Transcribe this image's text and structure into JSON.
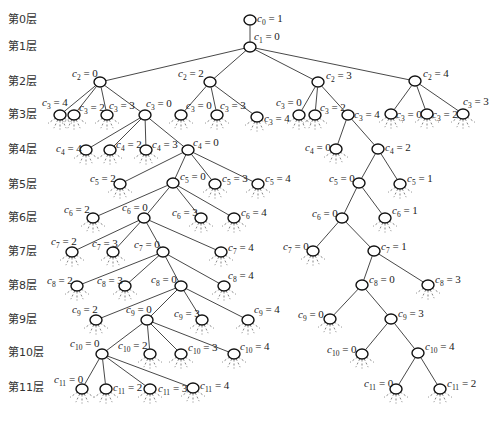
{
  "layer_labels": [
    {
      "text": "第0层",
      "y": 23
    },
    {
      "text": "第1层",
      "y": 50
    },
    {
      "text": "第2层",
      "y": 85
    },
    {
      "text": "第3层",
      "y": 118
    },
    {
      "text": "第4层",
      "y": 153
    },
    {
      "text": "第5层",
      "y": 188
    },
    {
      "text": "第6层",
      "y": 221
    },
    {
      "text": "第7层",
      "y": 255
    },
    {
      "text": "第8层",
      "y": 289
    },
    {
      "text": "第9层",
      "y": 323
    },
    {
      "text": "第10层",
      "y": 356
    },
    {
      "text": "第11层",
      "y": 391
    }
  ],
  "nodes": [
    {
      "id": "n0",
      "var": "c",
      "sub": "0",
      "val": "1",
      "x": 250,
      "y": 20,
      "parent": null,
      "lx": 257,
      "ly": 22,
      "anchor": "start",
      "stub": false
    },
    {
      "id": "n1",
      "var": "c",
      "sub": "1",
      "val": "0",
      "x": 250,
      "y": 47,
      "parent": "n0",
      "lx": 254,
      "ly": 40,
      "anchor": "start",
      "stub": false
    },
    {
      "id": "a2",
      "var": "c",
      "sub": "2",
      "val": "0",
      "x": 100,
      "y": 82,
      "parent": "n1",
      "lx": 72,
      "ly": 77,
      "anchor": "start",
      "stub": false
    },
    {
      "id": "b2",
      "var": "c",
      "sub": "2",
      "val": "2",
      "x": 210,
      "y": 82,
      "parent": "n1",
      "lx": 178,
      "ly": 77,
      "anchor": "start",
      "stub": false
    },
    {
      "id": "c2",
      "var": "c",
      "sub": "2",
      "val": "3",
      "x": 318,
      "y": 82,
      "parent": "n1",
      "lx": 326,
      "ly": 79,
      "anchor": "start",
      "stub": false
    },
    {
      "id": "d2",
      "var": "c",
      "sub": "2",
      "val": "4",
      "x": 415,
      "y": 81,
      "parent": "n1",
      "lx": 423,
      "ly": 77,
      "anchor": "start",
      "stub": false
    },
    {
      "id": "a3a",
      "var": "c",
      "sub": "3",
      "val": "4",
      "x": 60,
      "y": 115,
      "parent": "a2",
      "lx": 42,
      "ly": 106,
      "anchor": "start",
      "stub": true
    },
    {
      "id": "a3b",
      "var": "c",
      "sub": "3",
      "val": "2",
      "x": 74,
      "y": 115,
      "parent": "a2",
      "lx": 79,
      "ly": 111,
      "anchor": "start",
      "stub": true
    },
    {
      "id": "a3c",
      "var": "c",
      "sub": "3",
      "val": "3",
      "x": 107,
      "y": 115,
      "parent": "a2",
      "lx": 109,
      "ly": 109,
      "anchor": "start",
      "stub": true
    },
    {
      "id": "a3d",
      "var": "c",
      "sub": "3",
      "val": "0",
      "x": 145,
      "y": 115,
      "parent": "a2",
      "lx": 146,
      "ly": 107,
      "anchor": "start",
      "stub": false
    },
    {
      "id": "b3a",
      "var": "c",
      "sub": "3",
      "val": "0",
      "x": 181,
      "y": 115,
      "parent": "b2",
      "lx": 186,
      "ly": 109,
      "anchor": "start",
      "stub": true
    },
    {
      "id": "b3b",
      "var": "c",
      "sub": "3",
      "val": "3",
      "x": 217,
      "y": 115,
      "parent": "b2",
      "lx": 220,
      "ly": 109,
      "anchor": "start",
      "stub": true
    },
    {
      "id": "b3c",
      "var": "c",
      "sub": "3",
      "val": "4",
      "x": 257,
      "y": 117,
      "parent": "b2",
      "lx": 264,
      "ly": 122,
      "anchor": "start",
      "stub": true
    },
    {
      "id": "c3a",
      "var": "c",
      "sub": "3",
      "val": "0",
      "x": 299,
      "y": 115,
      "parent": "c2",
      "lx": 276,
      "ly": 106,
      "anchor": "start",
      "stub": true
    },
    {
      "id": "c3b",
      "var": "c",
      "sub": "3",
      "val": "2",
      "x": 315,
      "y": 115,
      "parent": "c2",
      "lx": 320,
      "ly": 111,
      "anchor": "start",
      "stub": true
    },
    {
      "id": "c3c",
      "var": "c",
      "sub": "3",
      "val": "4",
      "x": 348,
      "y": 115,
      "parent": "c2",
      "lx": 354,
      "ly": 118,
      "anchor": "start",
      "stub": false
    },
    {
      "id": "d3a",
      "var": "c",
      "sub": "3",
      "val": "0",
      "x": 391,
      "y": 114,
      "parent": "d2",
      "lx": 396,
      "ly": 118,
      "anchor": "start",
      "stub": true
    },
    {
      "id": "d3b",
      "var": "c",
      "sub": "3",
      "val": "2",
      "x": 427,
      "y": 114,
      "parent": "d2",
      "lx": 432,
      "ly": 118,
      "anchor": "start",
      "stub": true
    },
    {
      "id": "d3c",
      "var": "c",
      "sub": "3",
      "val": "3",
      "x": 463,
      "y": 114,
      "parent": "d2",
      "lx": 463,
      "ly": 105,
      "anchor": "start",
      "stub": true
    },
    {
      "id": "a4a",
      "var": "c",
      "sub": "4",
      "val": "4",
      "x": 86,
      "y": 150,
      "parent": "a3d",
      "lx": 56,
      "ly": 152,
      "anchor": "start",
      "stub": true
    },
    {
      "id": "a4b",
      "var": "c",
      "sub": "4",
      "val": "2",
      "x": 110,
      "y": 150,
      "parent": "a3d",
      "lx": 116,
      "ly": 148,
      "anchor": "start",
      "stub": true
    },
    {
      "id": "a4c",
      "var": "c",
      "sub": "4",
      "val": "3",
      "x": 146,
      "y": 150,
      "parent": "a3d",
      "lx": 152,
      "ly": 148,
      "anchor": "start",
      "stub": true
    },
    {
      "id": "a4d",
      "var": "c",
      "sub": "4",
      "val": "0",
      "x": 188,
      "y": 150,
      "parent": "a3d",
      "lx": 193,
      "ly": 146,
      "anchor": "start",
      "stub": false
    },
    {
      "id": "c4a",
      "var": "c",
      "sub": "4",
      "val": "0",
      "x": 336,
      "y": 149,
      "parent": "c3c",
      "lx": 305,
      "ly": 151,
      "anchor": "start",
      "stub": true
    },
    {
      "id": "c4b",
      "var": "c",
      "sub": "4",
      "val": "2",
      "x": 378,
      "y": 149,
      "parent": "c3c",
      "lx": 385,
      "ly": 151,
      "anchor": "start",
      "stub": false
    },
    {
      "id": "a5a",
      "var": "c",
      "sub": "5",
      "val": "2",
      "x": 120,
      "y": 184,
      "parent": "a4d",
      "lx": 90,
      "ly": 182,
      "anchor": "start",
      "stub": true
    },
    {
      "id": "a5b",
      "var": "c",
      "sub": "5",
      "val": "0",
      "x": 173,
      "y": 183,
      "parent": "a4d",
      "lx": 180,
      "ly": 180,
      "anchor": "start",
      "stub": false
    },
    {
      "id": "a5c",
      "var": "c",
      "sub": "5",
      "val": "3",
      "x": 215,
      "y": 184,
      "parent": "a4d",
      "lx": 222,
      "ly": 182,
      "anchor": "start",
      "stub": true
    },
    {
      "id": "a5d",
      "var": "c",
      "sub": "5",
      "val": "4",
      "x": 258,
      "y": 184,
      "parent": "a4d",
      "lx": 265,
      "ly": 182,
      "anchor": "start",
      "stub": true
    },
    {
      "id": "c5a",
      "var": "c",
      "sub": "5",
      "val": "0",
      "x": 359,
      "y": 183,
      "parent": "c4b",
      "lx": 329,
      "ly": 182,
      "anchor": "start",
      "stub": false
    },
    {
      "id": "c5b",
      "var": "c",
      "sub": "5",
      "val": "1",
      "x": 400,
      "y": 184,
      "parent": "c4b",
      "lx": 407,
      "ly": 182,
      "anchor": "start",
      "stub": true
    },
    {
      "id": "a6a",
      "var": "c",
      "sub": "6",
      "val": "2",
      "x": 93,
      "y": 218,
      "parent": "a5b",
      "lx": 64,
      "ly": 213,
      "anchor": "start",
      "stub": true
    },
    {
      "id": "a6b",
      "var": "c",
      "sub": "6",
      "val": "0",
      "x": 144,
      "y": 218,
      "parent": "a5b",
      "lx": 122,
      "ly": 211,
      "anchor": "start",
      "stub": false
    },
    {
      "id": "a6c",
      "var": "c",
      "sub": "6",
      "val": "3",
      "x": 201,
      "y": 218,
      "parent": "a5b",
      "lx": 172,
      "ly": 216,
      "anchor": "start",
      "stub": true
    },
    {
      "id": "a6d",
      "var": "c",
      "sub": "6",
      "val": "4",
      "x": 234,
      "y": 218,
      "parent": "a5b",
      "lx": 241,
      "ly": 216,
      "anchor": "start",
      "stub": true
    },
    {
      "id": "c6a",
      "var": "c",
      "sub": "6",
      "val": "0",
      "x": 342,
      "y": 218,
      "parent": "c5a",
      "lx": 312,
      "ly": 217,
      "anchor": "start",
      "stub": false
    },
    {
      "id": "c6b",
      "var": "c",
      "sub": "6",
      "val": "1",
      "x": 385,
      "y": 218,
      "parent": "c5a",
      "lx": 392,
      "ly": 214,
      "anchor": "start",
      "stub": true
    },
    {
      "id": "a7a",
      "var": "c",
      "sub": "7",
      "val": "2",
      "x": 72,
      "y": 252,
      "parent": "a6b",
      "lx": 51,
      "ly": 245,
      "anchor": "start",
      "stub": true
    },
    {
      "id": "a7b",
      "var": "c",
      "sub": "7",
      "val": "3",
      "x": 113,
      "y": 252,
      "parent": "a6b",
      "lx": 92,
      "ly": 247,
      "anchor": "start",
      "stub": true
    },
    {
      "id": "a7c",
      "var": "c",
      "sub": "7",
      "val": "0",
      "x": 163,
      "y": 252,
      "parent": "a6b",
      "lx": 134,
      "ly": 248,
      "anchor": "start",
      "stub": false
    },
    {
      "id": "a7d",
      "var": "c",
      "sub": "7",
      "val": "4",
      "x": 221,
      "y": 252,
      "parent": "a6b",
      "lx": 228,
      "ly": 251,
      "anchor": "start",
      "stub": true
    },
    {
      "id": "c7a",
      "var": "c",
      "sub": "7",
      "val": "0",
      "x": 313,
      "y": 251,
      "parent": "c6a",
      "lx": 283,
      "ly": 250,
      "anchor": "start",
      "stub": true
    },
    {
      "id": "c7b",
      "var": "c",
      "sub": "7",
      "val": "1",
      "x": 374,
      "y": 251,
      "parent": "c6a",
      "lx": 381,
      "ly": 250,
      "anchor": "start",
      "stub": false
    },
    {
      "id": "a8a",
      "var": "c",
      "sub": "8",
      "val": "2",
      "x": 77,
      "y": 286,
      "parent": "a7c",
      "lx": 47,
      "ly": 284,
      "anchor": "start",
      "stub": true
    },
    {
      "id": "a8b",
      "var": "c",
      "sub": "8",
      "val": "3",
      "x": 125,
      "y": 286,
      "parent": "a7c",
      "lx": 97,
      "ly": 284,
      "anchor": "start",
      "stub": true
    },
    {
      "id": "a8c",
      "var": "c",
      "sub": "8",
      "val": "0",
      "x": 181,
      "y": 286,
      "parent": "a7c",
      "lx": 151,
      "ly": 283,
      "anchor": "start",
      "stub": false
    },
    {
      "id": "a8d",
      "var": "c",
      "sub": "8",
      "val": "4",
      "x": 224,
      "y": 286,
      "parent": "a7c",
      "lx": 228,
      "ly": 279,
      "anchor": "start",
      "stub": true
    },
    {
      "id": "c8a",
      "var": "c",
      "sub": "8",
      "val": "0",
      "x": 362,
      "y": 285,
      "parent": "c7b",
      "lx": 369,
      "ly": 283,
      "anchor": "start",
      "stub": false
    },
    {
      "id": "c8b",
      "var": "c",
      "sub": "8",
      "val": "3",
      "x": 428,
      "y": 285,
      "parent": "c7b",
      "lx": 435,
      "ly": 283,
      "anchor": "start",
      "stub": true
    },
    {
      "id": "a9a",
      "var": "c",
      "sub": "9",
      "val": "2",
      "x": 96,
      "y": 320,
      "parent": "a8c",
      "lx": 72,
      "ly": 313,
      "anchor": "start",
      "stub": true
    },
    {
      "id": "a9b",
      "var": "c",
      "sub": "9",
      "val": "0",
      "x": 147,
      "y": 320,
      "parent": "a8c",
      "lx": 126,
      "ly": 313,
      "anchor": "start",
      "stub": false
    },
    {
      "id": "a9c",
      "var": "c",
      "sub": "9",
      "val": "3",
      "x": 202,
      "y": 320,
      "parent": "a8c",
      "lx": 174,
      "ly": 317,
      "anchor": "start",
      "stub": true
    },
    {
      "id": "a9d",
      "var": "c",
      "sub": "9",
      "val": "4",
      "x": 248,
      "y": 320,
      "parent": "a8c",
      "lx": 254,
      "ly": 313,
      "anchor": "start",
      "stub": true
    },
    {
      "id": "c9a",
      "var": "c",
      "sub": "9",
      "val": "0",
      "x": 330,
      "y": 319,
      "parent": "c8a",
      "lx": 298,
      "ly": 318,
      "anchor": "start",
      "stub": true
    },
    {
      "id": "c9b",
      "var": "c",
      "sub": "9",
      "val": "3",
      "x": 391,
      "y": 319,
      "parent": "c8a",
      "lx": 398,
      "ly": 317,
      "anchor": "start",
      "stub": false
    },
    {
      "id": "a10a",
      "var": "c",
      "sub": "10",
      "val": "0",
      "x": 102,
      "y": 354,
      "parent": "a9b",
      "lx": 70,
      "ly": 347,
      "anchor": "start",
      "stub": false
    },
    {
      "id": "a10b",
      "var": "c",
      "sub": "10",
      "val": "2",
      "x": 150,
      "y": 354,
      "parent": "a9b",
      "lx": 118,
      "ly": 349,
      "anchor": "start",
      "stub": true
    },
    {
      "id": "a10c",
      "var": "c",
      "sub": "10",
      "val": "3",
      "x": 181,
      "y": 354,
      "parent": "a9b",
      "lx": 188,
      "ly": 351,
      "anchor": "start",
      "stub": true
    },
    {
      "id": "a10d",
      "var": "c",
      "sub": "10",
      "val": "4",
      "x": 234,
      "y": 354,
      "parent": "a9b",
      "lx": 240,
      "ly": 350,
      "anchor": "start",
      "stub": true
    },
    {
      "id": "c10a",
      "var": "c",
      "sub": "10",
      "val": "0",
      "x": 362,
      "y": 354,
      "parent": "c9b",
      "lx": 327,
      "ly": 353,
      "anchor": "start",
      "stub": true
    },
    {
      "id": "c10b",
      "var": "c",
      "sub": "10",
      "val": "4",
      "x": 418,
      "y": 353,
      "parent": "c9b",
      "lx": 425,
      "ly": 350,
      "anchor": "start",
      "stub": false
    },
    {
      "id": "a11a",
      "var": "c",
      "sub": "11",
      "val": "0",
      "x": 82,
      "y": 389,
      "parent": "a10a",
      "lx": 54,
      "ly": 383,
      "anchor": "start",
      "stub": true
    },
    {
      "id": "a11b",
      "var": "c",
      "sub": "11",
      "val": "2",
      "x": 106,
      "y": 389,
      "parent": "a10a",
      "lx": 113,
      "ly": 391,
      "anchor": "start",
      "stub": true
    },
    {
      "id": "a11c",
      "var": "c",
      "sub": "11",
      "val": "3",
      "x": 150,
      "y": 389,
      "parent": "a10a",
      "lx": 158,
      "ly": 392,
      "anchor": "start",
      "stub": true
    },
    {
      "id": "a11d",
      "var": "c",
      "sub": "11",
      "val": "4",
      "x": 193,
      "y": 388,
      "parent": "a10a",
      "lx": 200,
      "ly": 389,
      "anchor": "start",
      "stub": true
    },
    {
      "id": "c11a",
      "var": "c",
      "sub": "11",
      "val": "0",
      "x": 396,
      "y": 389,
      "parent": "c10b",
      "lx": 364,
      "ly": 387,
      "anchor": "start",
      "stub": true
    },
    {
      "id": "c11b",
      "var": "c",
      "sub": "11",
      "val": "2",
      "x": 440,
      "y": 389,
      "parent": "c10b",
      "lx": 447,
      "ly": 387,
      "anchor": "start",
      "stub": true
    }
  ]
}
